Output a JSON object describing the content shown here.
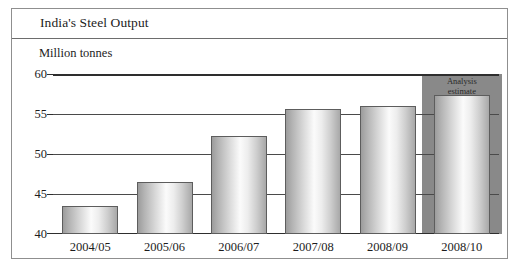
{
  "figure": {
    "title": "India's Steel Output",
    "ylabel": "Million tonnes",
    "annotation": {
      "line1": "Analysis",
      "line2": "estimate"
    },
    "colors": {
      "frame": "#8f8f8f",
      "gridline": "#4a4a4a",
      "axis": "#2e2e2e",
      "bar_edge": "#5d5d5d",
      "estimate_band": "#898989",
      "text": "#1d1d1d",
      "background": "#ffffff"
    }
  },
  "chart_data": {
    "type": "bar",
    "title": "India's Steel Output",
    "subtitle": "",
    "xlabel": "",
    "ylabel": "Million tonnes",
    "categories": [
      "2004/05",
      "2005/06",
      "2006/07",
      "2007/08",
      "2008/09",
      "2008/10"
    ],
    "values": [
      43.5,
      46.5,
      52.3,
      55.6,
      56.0,
      57.4
    ],
    "ylim": [
      40,
      60
    ],
    "yticks": [
      40,
      45,
      50,
      55,
      60
    ],
    "ytick_labels": [
      "40",
      "45",
      "50",
      "55",
      "60"
    ],
    "grid": true,
    "legend": false,
    "legend_position": "none",
    "annotations": [
      {
        "text": "Analysis estimate",
        "category": "2008/10",
        "note": "last bar is shaded with a dark grey background band marking it as a forecast"
      }
    ]
  }
}
